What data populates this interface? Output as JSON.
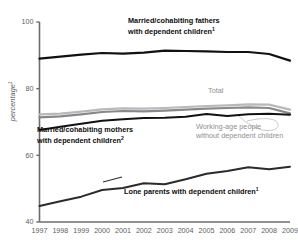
{
  "chart_data": {
    "type": "line",
    "title": "",
    "xlabel": "",
    "ylabel": "percentage",
    "ylabel_superscript": "1",
    "ylim": [
      40,
      100
    ],
    "yticks": [
      40,
      60,
      80,
      100
    ],
    "grid": false,
    "legend_position": "inline-annotations",
    "x": [
      1997,
      1998,
      1999,
      2000,
      2001,
      2002,
      2003,
      2004,
      2005,
      2006,
      2007,
      2008,
      2009
    ],
    "categories": [
      "1997",
      "1998",
      "1999",
      "2000",
      "2001",
      "2002",
      "2003",
      "2004",
      "2005",
      "2006",
      "2007",
      "2008",
      "2009"
    ],
    "series": [
      {
        "name": "Married/cohabiting fathers with dependent children",
        "name_superscript": "1",
        "color": "#111111",
        "width": 2.2,
        "values": [
          89.0,
          89.6,
          90.2,
          90.7,
          90.5,
          90.8,
          91.4,
          91.3,
          91.2,
          91.0,
          91.0,
          90.4,
          88.4
        ]
      },
      {
        "name": "Working-age people without dependent children",
        "color": "#b8b9bb",
        "width": 2.2,
        "values": [
          72.3,
          72.5,
          73.1,
          73.8,
          74.1,
          74.0,
          74.2,
          74.5,
          74.8,
          75.0,
          75.3,
          75.2,
          73.7
        ]
      },
      {
        "name": "Total",
        "color": "#87888b",
        "width": 2.2,
        "values": [
          71.4,
          71.7,
          72.3,
          73.0,
          73.3,
          73.2,
          73.4,
          73.7,
          74.0,
          74.2,
          74.4,
          74.2,
          72.6
        ]
      },
      {
        "name": "Married/cohabiting mothers with dependent children",
        "name_superscript": "2",
        "color": "#111111",
        "width": 2.0,
        "values": [
          67.6,
          68.6,
          69.5,
          70.4,
          70.8,
          71.2,
          71.3,
          71.6,
          72.4,
          71.8,
          72.3,
          72.5,
          72.2
        ]
      },
      {
        "name": "Lone parents with dependent children",
        "name_superscript": "1",
        "color": "#2b2b2b",
        "width": 2.0,
        "values": [
          44.8,
          46.2,
          47.6,
          49.6,
          50.2,
          51.6,
          51.3,
          52.8,
          54.5,
          55.3,
          56.4,
          55.8,
          56.6
        ]
      }
    ],
    "annotations": [
      {
        "id": "fathers",
        "text": "Married/cohabiting fathers",
        "text2": "with dependent children",
        "sup": "1",
        "color": "dark"
      },
      {
        "id": "mothers",
        "text": "Married/cohabiting mothers",
        "text2": "with dependent children",
        "sup": "2",
        "color": "dark"
      },
      {
        "id": "lone",
        "text": "Lone parents with dependent children",
        "sup": "1",
        "color": "dark"
      },
      {
        "id": "total",
        "text": "Total",
        "color": "grey"
      },
      {
        "id": "working",
        "text": "Working-age people",
        "text2": "without dependent children",
        "color": "grey"
      }
    ]
  },
  "axis": {
    "y_labels": [
      "100",
      "80",
      "60",
      "40"
    ],
    "x_labels": [
      "1997",
      "1998",
      "1999",
      "2000",
      "2001",
      "2002",
      "2003",
      "2004",
      "2005",
      "2006",
      "2007",
      "2008",
      "2009"
    ],
    "y_axis_title": "percentage",
    "y_axis_title_sup": "1",
    "axis_color": "#6b6c6f"
  },
  "annotations": {
    "fathers_line1": "Married/cohabiting fathers",
    "fathers_line2": "with dependent children",
    "fathers_sup": "1",
    "mothers_line1": "Married/cohabiting mothers",
    "mothers_line2": "with dependent children",
    "mothers_sup": "2",
    "lone_line1": "Lone parents with dependent children",
    "lone_sup": "1",
    "total_label": "Total",
    "working_line1": "Working-age people",
    "working_line2": "without dependent children"
  },
  "colors": {
    "fathers": "#111111",
    "mothers": "#111111",
    "lone": "#2b2b2b",
    "total": "#87888b",
    "working_age": "#b8b9bb",
    "axis": "#6b6c6f",
    "tick_text": "#5f6063",
    "grey_text": "#8e8f93"
  }
}
